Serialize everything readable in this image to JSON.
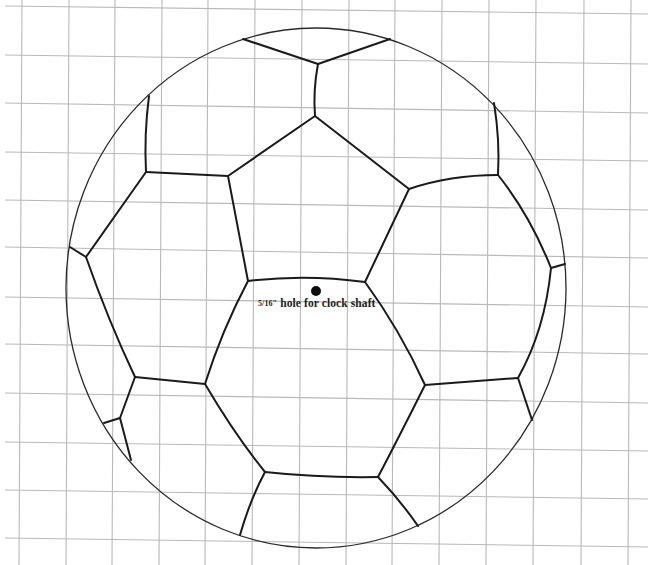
{
  "figure": {
    "type": "template drawing",
    "annotation": {
      "fraction": "5/16\"",
      "text": " hole for clock shaft"
    }
  },
  "colors": {
    "grid": "#b9b9b9",
    "outline": "#2a2a2a",
    "seams": "#1a1a1a",
    "background": "#ffffff"
  },
  "grid": {
    "vertical_x": [
      21,
      68,
      114,
      161,
      207,
      254,
      301,
      348,
      394,
      441,
      488,
      535,
      583,
      630
    ],
    "horizontal_y_left": [
      6,
      55,
      103,
      152,
      200,
      247,
      297,
      344,
      393,
      442,
      490,
      538
    ],
    "horizontal_y_right": [
      13,
      63,
      112,
      160,
      209,
      257,
      306,
      353,
      402,
      450,
      498,
      546
    ]
  },
  "ball": {
    "center": [
      316,
      288
    ],
    "rx": 250,
    "ry": 260
  },
  "hole": {
    "x": 316,
    "y": 291,
    "r": 5
  }
}
